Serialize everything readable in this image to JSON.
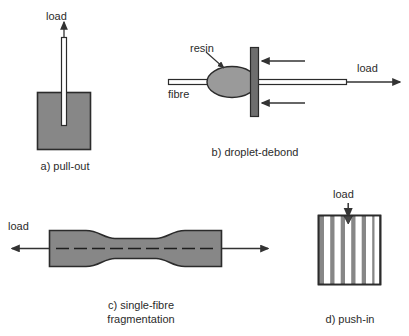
{
  "figure": {
    "colors": {
      "matrix_gray": "#878787",
      "outline_dark": "#2b2b2b",
      "fibre_white": "#ffffff",
      "arrow_dark": "#333333",
      "plate_gray": "#6e6e6e",
      "background": "#ffffff"
    }
  },
  "panels": [
    {
      "id": "a",
      "caption": "a) pull-out",
      "labels": {
        "load": "load"
      }
    },
    {
      "id": "b",
      "caption": "b) droplet-debond",
      "labels": {
        "resin": "resin",
        "fibre": "fibre",
        "load": "load"
      }
    },
    {
      "id": "c",
      "caption": "c) single-fibre\nfragmentation",
      "labels": {
        "load": "load"
      }
    },
    {
      "id": "d",
      "caption": "d) push-in",
      "labels": {
        "load": "load"
      }
    }
  ]
}
